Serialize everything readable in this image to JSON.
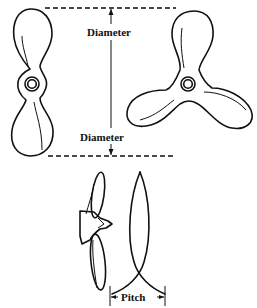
{
  "figure": {
    "labels": {
      "diameter_top": "Diameter",
      "diameter_bottom": "Diameter",
      "pitch": "Pitch"
    },
    "elements": {
      "two_blade_propeller": "front view, two blades",
      "three_blade_propeller": "front view, three blades",
      "side_view_propeller": "side view",
      "helix_path": "blade tip helical path"
    },
    "colors": {
      "ink": "#111111",
      "background": "#ffffff"
    }
  }
}
